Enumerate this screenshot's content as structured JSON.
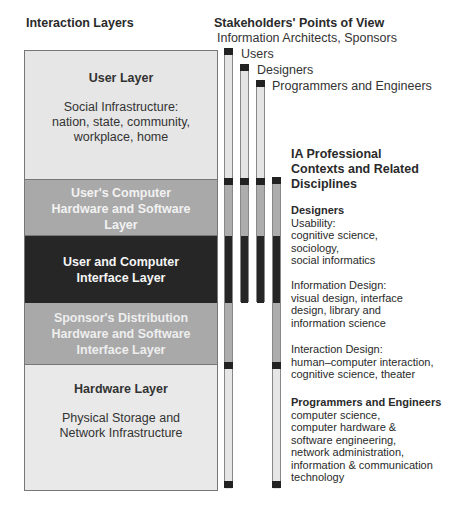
{
  "left_header": "Interaction Layers",
  "stakeholders": {
    "title": "Stakeholders' Points of View",
    "labels": [
      "Information Architects,  Sponsors",
      "Users",
      "Designers",
      "Programmers and Engineers"
    ]
  },
  "layers": [
    {
      "title": "User Layer",
      "desc": [
        "Social Infrastructure:",
        "nation, state, community,",
        "workplace, home"
      ]
    },
    {
      "title_lines": [
        "User's Computer",
        "Hardware and Software",
        "Layer"
      ]
    },
    {
      "title_lines": [
        "User and Computer",
        "Interface Layer"
      ]
    },
    {
      "title_lines": [
        "Sponsor's Distribution",
        "Hardware and Software",
        "Interface Layer"
      ]
    },
    {
      "title": "Hardware Layer",
      "desc": [
        "Physical Storage and",
        "Network Infrastructure"
      ]
    }
  ],
  "contexts": {
    "title_lines": [
      "IA Professional",
      "Contexts and Related",
      "Disciplines"
    ],
    "designers_heading": "Designers",
    "usability": [
      "Usability:",
      "cognitive science,",
      "sociology,",
      "social informatics"
    ],
    "info_design": [
      "Information Design:",
      "visual design, interface",
      "design, library and",
      "information science"
    ],
    "interaction_design": [
      "Interaction Design:",
      "human–computer interaction,",
      "cognitive science, theater"
    ],
    "prog_heading": "Programmers and Engineers",
    "prog_items": [
      "computer science,",
      "computer hardware &",
      "software engineering,",
      "network administration,",
      "information & communication",
      "technology"
    ]
  },
  "colors": {
    "light_layer": "#e6e6e6",
    "mid_layer": "#a9a9a9",
    "dark_layer": "#262626",
    "bar_cap": "#222222"
  }
}
